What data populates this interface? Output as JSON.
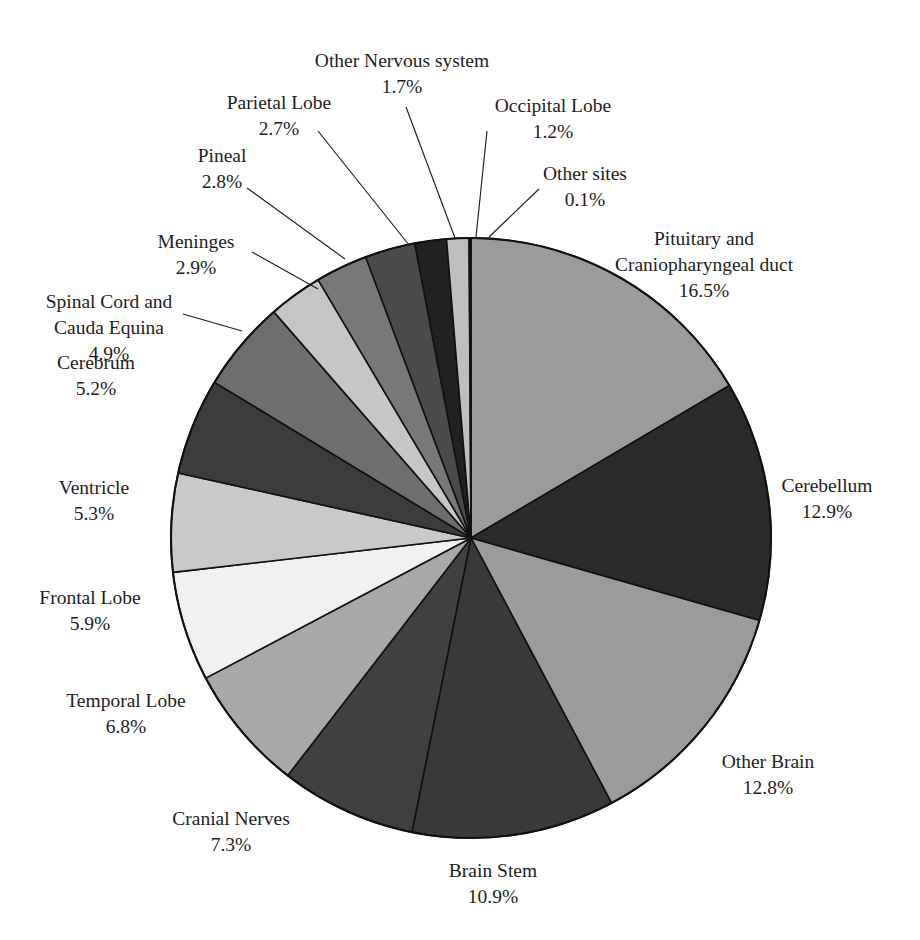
{
  "figure": {
    "background_color": "#ffffff",
    "text_color": "#1e1e1e",
    "outline_color": "#111111",
    "width": 920,
    "height": 940
  },
  "pie_geometry": {
    "center_x": 471,
    "center_y": 538,
    "radius": 300,
    "start_angle_deg": -90,
    "direction": "clockwise"
  },
  "chart_data": {
    "type": "pie",
    "title": "",
    "subtitle": "",
    "xlabel": "",
    "ylabel": "",
    "units": "percent",
    "grid": false,
    "legend_position": "none",
    "labels_outside": true,
    "total": 100.0,
    "categories": [
      "Pituitary and Craniopharyngeal duct",
      "Cerebellum",
      "Other Brain",
      "Brain Stem",
      "Cranial Nerves",
      "Temporal Lobe",
      "Frontal Lobe",
      "Ventricle",
      "Cerebrum",
      "Spinal Cord and Cauda Equina",
      "Meninges",
      "Pineal",
      "Parietal Lobe",
      "Other Nervous system",
      "Occipital Lobe",
      "Other sites"
    ],
    "values": [
      16.5,
      12.9,
      12.8,
      10.9,
      7.3,
      6.8,
      5.9,
      5.3,
      5.2,
      4.9,
      2.9,
      2.8,
      2.7,
      1.7,
      1.2,
      0.1
    ],
    "colors": [
      "#9b9b9b",
      "#2b2b2b",
      "#9b9b9b",
      "#3a3a3a",
      "#404040",
      "#a8a8a8",
      "#f1f1f1",
      "#c9c9c9",
      "#3c3c3c",
      "#6e6e6e",
      "#c6c6c6",
      "#787878",
      "#4a4a4a",
      "#212121",
      "#bfbfbf",
      "#111111"
    ]
  },
  "slices": [
    {
      "name": "Pituitary and Craniopharyngeal duct",
      "value": 16.5,
      "percent_label": "16.5%",
      "color": "#9b9b9b",
      "label_lines": [
        "Pituitary and",
        "Craniopharyngeal duct"
      ],
      "label_x": 704,
      "label_y": 245,
      "label_anchor": "middle",
      "leader": null
    },
    {
      "name": "Cerebellum",
      "value": 12.9,
      "percent_label": "12.9%",
      "color": "#2b2b2b",
      "label_lines": [
        "Cerebellum"
      ],
      "label_x": 827,
      "label_y": 492,
      "label_anchor": "middle",
      "leader": null
    },
    {
      "name": "Other Brain",
      "value": 12.8,
      "percent_label": "12.8%",
      "color": "#9b9b9b",
      "label_lines": [
        "Other Brain"
      ],
      "label_x": 768,
      "label_y": 768,
      "label_anchor": "middle",
      "leader": null
    },
    {
      "name": "Brain Stem",
      "value": 10.9,
      "percent_label": "10.9%",
      "color": "#3a3a3a",
      "label_lines": [
        "Brain Stem"
      ],
      "label_x": 493,
      "label_y": 877,
      "label_anchor": "middle",
      "leader": null
    },
    {
      "name": "Cranial Nerves",
      "value": 7.3,
      "percent_label": "7.3%",
      "color": "#404040",
      "label_lines": [
        "Cranial Nerves"
      ],
      "label_x": 231,
      "label_y": 825,
      "label_anchor": "middle",
      "leader": null
    },
    {
      "name": "Temporal Lobe",
      "value": 6.8,
      "percent_label": "6.8%",
      "color": "#a8a8a8",
      "label_lines": [
        "Temporal Lobe"
      ],
      "label_x": 126,
      "label_y": 707,
      "label_anchor": "middle",
      "leader": null
    },
    {
      "name": "Frontal Lobe",
      "value": 5.9,
      "percent_label": "5.9%",
      "color": "#f1f1f1",
      "label_lines": [
        "Frontal Lobe"
      ],
      "label_x": 90,
      "label_y": 604,
      "label_anchor": "middle",
      "leader": null
    },
    {
      "name": "Ventricle",
      "value": 5.3,
      "percent_label": "5.3%",
      "color": "#c9c9c9",
      "label_lines": [
        "Ventricle"
      ],
      "label_x": 94,
      "label_y": 494,
      "label_anchor": "middle",
      "leader": null
    },
    {
      "name": "Cerebrum",
      "value": 5.2,
      "percent_label": "5.2%",
      "color": "#3c3c3c",
      "label_lines": [
        "Cerebrum"
      ],
      "label_x": 96,
      "label_y": 369,
      "label_anchor": "middle",
      "leader": null
    },
    {
      "name": "Spinal Cord and Cauda Equina",
      "value": 4.9,
      "percent_label": "4.9%",
      "color": "#6e6e6e",
      "label_lines": [
        "Spinal Cord and",
        "Cauda Equina"
      ],
      "label_x": 109,
      "label_y": 308,
      "label_anchor": "middle",
      "leader": {
        "x1": 183,
        "y1": 314,
        "x2": 242,
        "y2": 331
      }
    },
    {
      "name": "Meninges",
      "value": 2.9,
      "percent_label": "2.9%",
      "color": "#c6c6c6",
      "label_lines": [
        "Meninges"
      ],
      "label_x": 196,
      "label_y": 248,
      "label_anchor": "middle",
      "leader": {
        "x1": 252,
        "y1": 252,
        "x2": 318,
        "y2": 289
      }
    },
    {
      "name": "Pineal",
      "value": 2.8,
      "percent_label": "2.8%",
      "color": "#787878",
      "label_lines": [
        "Pineal"
      ],
      "label_x": 222,
      "label_y": 162,
      "label_anchor": "middle",
      "leader": {
        "x1": 247,
        "y1": 188,
        "x2": 345,
        "y2": 259
      }
    },
    {
      "name": "Parietal Lobe",
      "value": 2.7,
      "percent_label": "2.7%",
      "color": "#4a4a4a",
      "label_lines": [
        "Parietal Lobe"
      ],
      "label_x": 279,
      "label_y": 109,
      "label_anchor": "middle",
      "leader": {
        "x1": 318,
        "y1": 131,
        "x2": 409,
        "y2": 245
      }
    },
    {
      "name": "Other Nervous system",
      "value": 1.7,
      "percent_label": "1.7%",
      "color": "#212121",
      "label_lines": [
        "Other Nervous system"
      ],
      "label_x": 402,
      "label_y": 67,
      "label_anchor": "middle",
      "leader": {
        "x1": 406,
        "y1": 107,
        "x2": 455,
        "y2": 238
      }
    },
    {
      "name": "Occipital Lobe",
      "value": 1.2,
      "percent_label": "1.2%",
      "color": "#bfbfbf",
      "label_lines": [
        "Occipital Lobe"
      ],
      "label_x": 553,
      "label_y": 112,
      "label_anchor": "middle",
      "leader": {
        "x1": 487,
        "y1": 131,
        "x2": 476,
        "y2": 237
      }
    },
    {
      "name": "Other sites",
      "value": 0.1,
      "percent_label": "0.1%",
      "color": "#111111",
      "label_lines": [
        "Other sites"
      ],
      "label_x": 585,
      "label_y": 180,
      "label_anchor": "middle",
      "leader": {
        "x1": 539,
        "y1": 189,
        "x2": 489,
        "y2": 237
      }
    }
  ]
}
